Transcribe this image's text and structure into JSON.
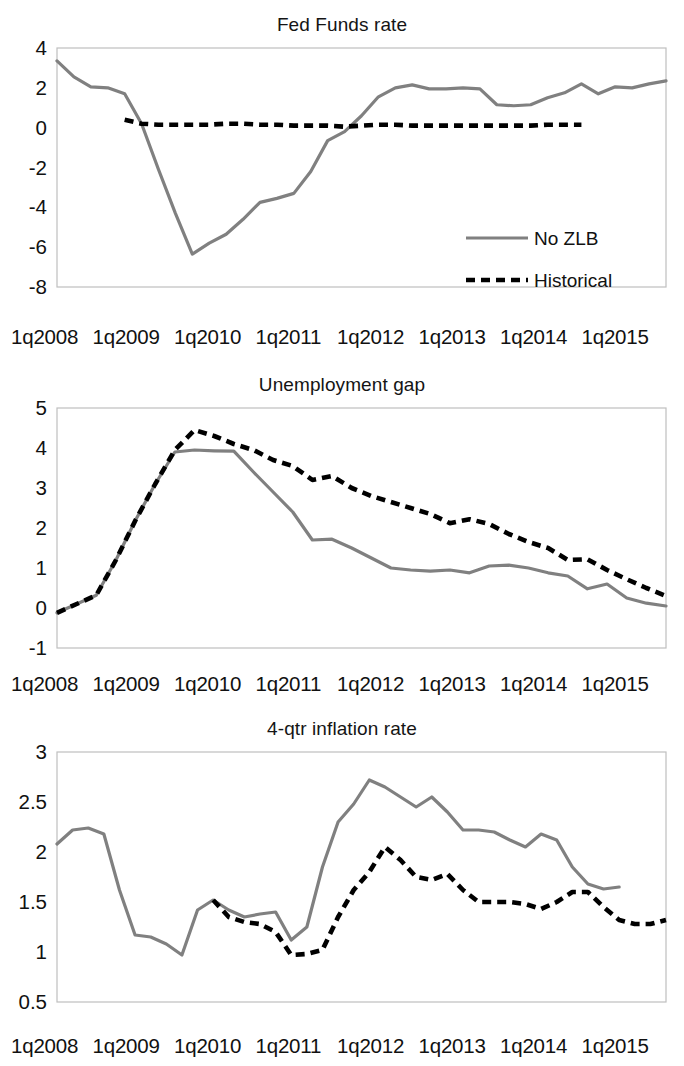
{
  "figure": {
    "series_names": [
      "No ZLB",
      "Historical"
    ],
    "colors": {
      "no_zlb": "#808080",
      "historical": "#000000",
      "plot_border": "#bfbfbf",
      "background": "#ffffff"
    },
    "x_tick_labels": [
      "1q2008",
      "1q2009",
      "1q2010",
      "1q2011",
      "1q2012",
      "1q2013",
      "1q2014",
      "1q2015"
    ]
  },
  "legend": {
    "items": [
      {
        "label": "No ZLB",
        "style": "solid",
        "color": "#808080"
      },
      {
        "label": "Historical",
        "style": "dashed",
        "color": "#000000"
      }
    ]
  },
  "chart_data": [
    {
      "id": "fed-funds-rate",
      "type": "line",
      "title": "Fed Funds rate",
      "xlabel": "",
      "ylabel": "",
      "ylim": [
        -8,
        4
      ],
      "yticks": [
        4,
        2,
        0,
        -2,
        -4,
        -6,
        -8
      ],
      "ytick_labels": [
        "4",
        "2",
        "0",
        "-2",
        "-4",
        "-6",
        "-8"
      ],
      "grid": false,
      "legend_position": "inside-right-middle",
      "x": [
        "1q2008",
        "2q2008",
        "3q2008",
        "4q2008",
        "1q2009",
        "2q2009",
        "3q2009",
        "4q2009",
        "1q2010",
        "2q2010",
        "3q2010",
        "4q2010",
        "1q2011",
        "2q2011",
        "3q2011",
        "4q2011",
        "1q2012",
        "2q2012",
        "3q2012",
        "4q2012",
        "1q2013",
        "2q2013",
        "3q2013",
        "4q2013",
        "1q2014",
        "2q2014",
        "3q2014",
        "4q2014",
        "1q2015",
        "2q2015",
        "3q2015",
        "4q2015"
      ],
      "series": [
        {
          "name": "No ZLB",
          "style": "solid",
          "color": "#808080",
          "values": [
            3.35,
            2.55,
            2.05,
            2.0,
            1.7,
            0.2,
            -2.1,
            -4.3,
            -6.35,
            -5.8,
            -5.35,
            -4.6,
            -3.75,
            -3.55,
            -3.3,
            -2.2,
            -0.65,
            -0.2,
            0.6,
            1.55,
            2.0,
            2.15,
            1.95,
            1.95,
            2.0,
            1.95,
            1.15,
            1.1,
            1.15,
            1.5,
            1.75,
            2.2,
            1.7,
            2.05,
            2.0,
            2.2,
            2.35
          ]
        },
        {
          "name": "Historical",
          "style": "dashed",
          "color": "#000000",
          "values": [
            null,
            null,
            null,
            null,
            0.4,
            0.2,
            0.15,
            0.15,
            0.15,
            0.15,
            0.2,
            0.2,
            0.15,
            0.15,
            0.1,
            0.1,
            0.1,
            0.05,
            0.1,
            0.15,
            0.15,
            0.1,
            0.1,
            0.1,
            0.1,
            0.1,
            0.1,
            0.1,
            0.1,
            0.15,
            0.15,
            0.15
          ]
        }
      ]
    },
    {
      "id": "unemployment-gap",
      "type": "line",
      "title": "Unemployment gap",
      "xlabel": "",
      "ylabel": "",
      "ylim": [
        -1,
        5
      ],
      "yticks": [
        5,
        4,
        3,
        2,
        1,
        0,
        -1
      ],
      "ytick_labels": [
        "5",
        "4",
        "3",
        "2",
        "1",
        "0",
        "-1"
      ],
      "grid": false,
      "legend_position": "none",
      "x": [
        "1q2008",
        "2q2008",
        "3q2008",
        "4q2008",
        "1q2009",
        "2q2009",
        "3q2009",
        "4q2009",
        "1q2010",
        "2q2010",
        "3q2010",
        "4q2010",
        "1q2011",
        "2q2011",
        "3q2011",
        "4q2011",
        "1q2012",
        "2q2012",
        "3q2012",
        "4q2012",
        "1q2013",
        "2q2013",
        "3q2013",
        "4q2013",
        "1q2014",
        "2q2014",
        "3q2014",
        "4q2014",
        "1q2015",
        "2q2015",
        "3q2015",
        "4q2015"
      ],
      "series": [
        {
          "name": "No ZLB",
          "style": "solid",
          "color": "#808080",
          "values": [
            -0.12,
            0.1,
            0.32,
            1.2,
            2.2,
            3.1,
            3.9,
            3.95,
            3.93,
            3.92,
            3.4,
            2.9,
            2.4,
            1.7,
            1.72,
            1.5,
            1.25,
            1.0,
            0.95,
            0.92,
            0.95,
            0.88,
            1.05,
            1.07,
            1.0,
            0.88,
            0.8,
            0.48,
            0.6,
            0.25,
            0.12,
            0.05
          ]
        },
        {
          "name": "Historical",
          "style": "dashed",
          "color": "#000000",
          "values": [
            -0.12,
            0.1,
            0.32,
            1.2,
            2.2,
            3.1,
            3.95,
            4.45,
            4.3,
            4.1,
            3.95,
            3.7,
            3.55,
            3.2,
            3.3,
            3.0,
            2.8,
            2.65,
            2.5,
            2.35,
            2.12,
            2.22,
            2.1,
            1.85,
            1.65,
            1.5,
            1.2,
            1.22,
            0.95,
            0.72,
            0.5,
            0.3
          ]
        }
      ]
    },
    {
      "id": "four-qtr-inflation-rate",
      "type": "line",
      "title": "4-qtr inflation rate",
      "xlabel": "",
      "ylabel": "",
      "ylim": [
        0.5,
        3
      ],
      "yticks": [
        3,
        2.5,
        2,
        1.5,
        1,
        0.5
      ],
      "ytick_labels": [
        "3",
        "2.5",
        "2",
        "1.5",
        "1",
        "0.5"
      ],
      "grid": false,
      "legend_position": "none",
      "x": [
        "1q2008",
        "2q2008",
        "3q2008",
        "4q2008",
        "1q2009",
        "2q2009",
        "3q2009",
        "4q2009",
        "1q2010",
        "2q2010",
        "3q2010",
        "4q2010",
        "1q2011",
        "2q2011",
        "3q2011",
        "4q2011",
        "1q2012",
        "2q2012",
        "3q2012",
        "4q2012",
        "1q2013",
        "2q2013",
        "3q2013",
        "4q2013",
        "1q2014",
        "2q2014",
        "3q2014",
        "4q2014",
        "1q2015",
        "2q2015",
        "3q2015",
        "4q2015"
      ],
      "series": [
        {
          "name": "No ZLB",
          "style": "solid",
          "color": "#808080",
          "values": [
            2.08,
            2.22,
            2.24,
            2.18,
            1.62,
            1.17,
            1.15,
            1.08,
            0.97,
            1.42,
            1.52,
            1.42,
            1.35,
            1.38,
            1.4,
            1.12,
            1.25,
            1.85,
            2.3,
            2.48,
            2.72,
            2.65,
            2.55,
            2.45,
            2.55,
            2.4,
            2.22,
            2.22,
            2.2,
            2.12,
            2.05,
            2.18,
            2.12,
            1.85,
            1.68,
            1.63,
            1.65
          ]
        },
        {
          "name": "Historical",
          "style": "dashed",
          "color": "#000000",
          "values": [
            null,
            null,
            null,
            null,
            null,
            null,
            null,
            null,
            null,
            null,
            1.52,
            1.35,
            1.3,
            1.28,
            1.2,
            0.97,
            0.98,
            1.02,
            1.35,
            1.62,
            1.8,
            2.05,
            1.92,
            1.75,
            1.72,
            1.78,
            1.62,
            1.5,
            1.5,
            1.5,
            1.48,
            1.43,
            1.5,
            1.6,
            1.6,
            1.45,
            1.32,
            1.28,
            1.28,
            1.32
          ]
        }
      ]
    }
  ]
}
